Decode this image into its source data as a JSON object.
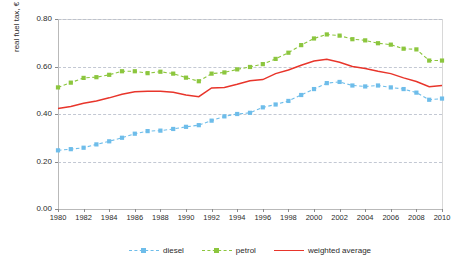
{
  "chart_data": {
    "type": "line",
    "title": "",
    "xlabel": "",
    "ylabel": "real fuel tax, € (2010) per litre",
    "xlim": [
      1980,
      2010
    ],
    "ylim": [
      0.0,
      0.8
    ],
    "grid": true,
    "legend_position": "bottom-center",
    "ytick_labels": [
      "0.00",
      "0.20",
      "0.40",
      "0.60",
      "0.80"
    ],
    "ytick_values": [
      0.0,
      0.2,
      0.4,
      0.6,
      0.8
    ],
    "xtick_labels": [
      "1980",
      "1982",
      "1984",
      "1986",
      "1988",
      "1990",
      "1992",
      "1994",
      "1996",
      "1998",
      "2000",
      "2002",
      "2004",
      "2006",
      "2008",
      "2010"
    ],
    "xtick_values": [
      1980,
      1982,
      1984,
      1986,
      1988,
      1990,
      1992,
      1994,
      1996,
      1998,
      2000,
      2002,
      2004,
      2006,
      2008,
      2010
    ],
    "x": [
      1980,
      1981,
      1982,
      1983,
      1984,
      1985,
      1986,
      1987,
      1988,
      1989,
      1990,
      1991,
      1992,
      1993,
      1994,
      1995,
      1996,
      1997,
      1998,
      1999,
      2000,
      2001,
      2002,
      2003,
      2004,
      2005,
      2006,
      2007,
      2008,
      2009,
      2010
    ],
    "series": [
      {
        "name": "diesel",
        "color": "#6EBDEA",
        "style": "dashed",
        "marker": "square",
        "values": [
          0.247,
          0.252,
          0.258,
          0.272,
          0.285,
          0.3,
          0.317,
          0.328,
          0.33,
          0.337,
          0.346,
          0.353,
          0.372,
          0.39,
          0.4,
          0.405,
          0.428,
          0.44,
          0.455,
          0.48,
          0.505,
          0.53,
          0.535,
          0.52,
          0.516,
          0.52,
          0.512,
          0.505,
          0.49,
          0.46,
          0.465
        ]
      },
      {
        "name": "petrol",
        "color": "#8CC63E",
        "style": "dashed",
        "marker": "square",
        "values": [
          0.512,
          0.532,
          0.552,
          0.555,
          0.565,
          0.58,
          0.58,
          0.572,
          0.578,
          0.57,
          0.553,
          0.538,
          0.57,
          0.575,
          0.588,
          0.598,
          0.61,
          0.632,
          0.658,
          0.69,
          0.718,
          0.735,
          0.73,
          0.715,
          0.71,
          0.698,
          0.692,
          0.675,
          0.672,
          0.625,
          0.625
        ]
      },
      {
        "name": "weighted average",
        "color": "#E8352B",
        "style": "solid",
        "marker": "none",
        "values": [
          0.423,
          0.432,
          0.445,
          0.455,
          0.468,
          0.483,
          0.494,
          0.496,
          0.496,
          0.492,
          0.48,
          0.473,
          0.51,
          0.512,
          0.525,
          0.54,
          0.545,
          0.57,
          0.585,
          0.605,
          0.623,
          0.63,
          0.618,
          0.6,
          0.592,
          0.58,
          0.57,
          0.552,
          0.537,
          0.515,
          0.52
        ]
      }
    ]
  },
  "legend": {
    "items": [
      {
        "label": "diesel"
      },
      {
        "label": "petrol"
      },
      {
        "label": "weighted average"
      }
    ]
  }
}
